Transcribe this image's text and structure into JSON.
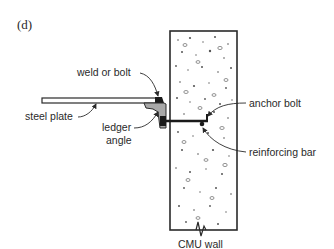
{
  "figure": {
    "label": "(d)",
    "labels": {
      "weld_or_bolt": "weld or bolt",
      "steel_plate": "steel plate",
      "ledger_line1": "ledger",
      "ledger_line2": "angle",
      "anchor_bolt": "anchor bolt",
      "reinforcing_bar": "reinforcing bar",
      "cmu_wall": "CMU wall"
    },
    "colors": {
      "line": "#2a2a2a",
      "angle_fill": "#a8a8a8",
      "wall_fill": "#ffffff"
    }
  }
}
